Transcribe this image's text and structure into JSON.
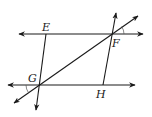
{
  "diagram": {
    "points": [
      {
        "name": "E",
        "x": 46,
        "y": 34,
        "label_x": 42,
        "label_y": 31
      },
      {
        "name": "F",
        "x": 111,
        "y": 34,
        "label_x": 112,
        "label_y": 47
      },
      {
        "name": "G",
        "x": 39,
        "y": 85,
        "label_x": 28,
        "label_y": 82
      },
      {
        "name": "H",
        "x": 103,
        "y": 85,
        "label_x": 96,
        "label_y": 98
      }
    ],
    "lines": [
      {
        "id": "top-parallel-line",
        "x1": 19,
        "y1": 34,
        "x2": 143,
        "y2": 34,
        "arrows": "both"
      },
      {
        "id": "bottom-parallel-line",
        "x1": 8,
        "y1": 85,
        "x2": 135,
        "y2": 85,
        "arrows": "both"
      },
      {
        "id": "transversal-GF",
        "x1": 14,
        "y1": 103,
        "x2": 138,
        "y2": 16,
        "arrows": "both"
      },
      {
        "id": "line-FH",
        "x1": 116,
        "y1": 13,
        "x2": 103,
        "y2": 85,
        "arrows": "start"
      },
      {
        "id": "line-EG",
        "x1": 46,
        "y1": 34,
        "x2": 36,
        "y2": 110,
        "arrows": "end"
      }
    ],
    "angle_marks": [
      {
        "at": "G",
        "position": "left-below"
      },
      {
        "at": "F",
        "position": "right-above"
      }
    ],
    "colors": {
      "stroke": "#1a1a1a",
      "background": "#ffffff"
    }
  }
}
